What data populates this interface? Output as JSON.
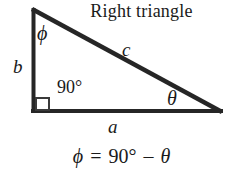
{
  "figure": {
    "title": "Right triangle",
    "background_color": "#ffffff",
    "ink_color": "#1a1a1a",
    "width": 243,
    "height": 177
  },
  "diagram": {
    "type": "right-triangle",
    "stroke_color": "#262626",
    "stroke_width": 4,
    "vertices": {
      "apex": [
        32,
        9
      ],
      "bottom_left": [
        32,
        112
      ],
      "bottom_right": [
        222,
        112
      ]
    },
    "right_angle_marker": {
      "x": 33,
      "y": 99,
      "size": 13
    }
  },
  "labels": {
    "phi_apex": "ϕ",
    "side_b": "b",
    "side_c": "c",
    "right_angle": "90°",
    "theta": "θ",
    "side_a": "a"
  },
  "equation": {
    "lhs": "ϕ",
    "equals": "=",
    "degrees": "90°",
    "minus": "–",
    "rhs": "θ",
    "full_text": "ϕ = 90° – θ"
  }
}
